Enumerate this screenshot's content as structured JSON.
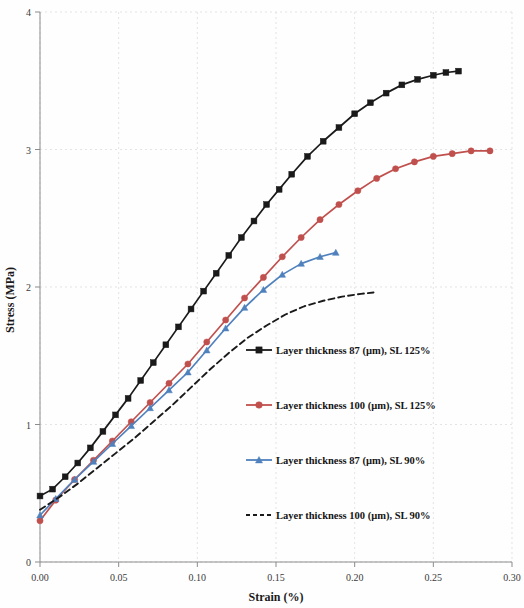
{
  "figure": {
    "background": "#fefefe",
    "plot_area": {
      "left": 40,
      "right": 512,
      "top": 12,
      "bottom": 562
    }
  },
  "chart_data": {
    "type": "line",
    "title": "",
    "xlabel": "Strain (%)",
    "ylabel": "Stress (MPa)",
    "xlim": [
      0.0,
      0.3
    ],
    "ylim": [
      0,
      4
    ],
    "xticks": [
      "0.00",
      "0.05",
      "0.10",
      "0.15",
      "0.20",
      "0.25",
      "0.30"
    ],
    "xtick_values": [
      0.0,
      0.05,
      0.1,
      0.15,
      0.2,
      0.25,
      0.3
    ],
    "yticks": [
      "0",
      "1",
      "2",
      "3",
      "4"
    ],
    "ytick_values": [
      0,
      1,
      2,
      3,
      4
    ],
    "grid": "y-dotted-light",
    "legend_position": "inside-right-lower",
    "series": [
      {
        "name": "Layer thickness 87 (µm), SL 125%",
        "color": "#1a1a1a",
        "marker": "square",
        "dash": "solid",
        "x": [
          0.0,
          0.008,
          0.016,
          0.024,
          0.032,
          0.04,
          0.048,
          0.056,
          0.064,
          0.072,
          0.08,
          0.088,
          0.096,
          0.104,
          0.112,
          0.12,
          0.128,
          0.136,
          0.144,
          0.152,
          0.16,
          0.17,
          0.18,
          0.19,
          0.2,
          0.21,
          0.22,
          0.23,
          0.24,
          0.25,
          0.258,
          0.266
        ],
        "y": [
          0.48,
          0.53,
          0.62,
          0.72,
          0.83,
          0.95,
          1.07,
          1.19,
          1.32,
          1.45,
          1.58,
          1.71,
          1.84,
          1.97,
          2.1,
          2.23,
          2.36,
          2.48,
          2.6,
          2.71,
          2.82,
          2.95,
          3.06,
          3.16,
          3.26,
          3.34,
          3.41,
          3.47,
          3.51,
          3.54,
          3.56,
          3.57
        ]
      },
      {
        "name": "Layer thickness 100 (µm), SL 125%",
        "color": "#C0504D",
        "marker": "circle",
        "dash": "solid",
        "x": [
          0.0,
          0.01,
          0.022,
          0.034,
          0.046,
          0.058,
          0.07,
          0.082,
          0.094,
          0.106,
          0.118,
          0.13,
          0.142,
          0.154,
          0.166,
          0.178,
          0.19,
          0.202,
          0.214,
          0.226,
          0.238,
          0.25,
          0.262,
          0.274,
          0.286
        ],
        "y": [
          0.3,
          0.45,
          0.6,
          0.74,
          0.88,
          1.02,
          1.16,
          1.3,
          1.44,
          1.6,
          1.76,
          1.92,
          2.07,
          2.22,
          2.36,
          2.49,
          2.6,
          2.7,
          2.79,
          2.86,
          2.91,
          2.95,
          2.97,
          2.99,
          2.99
        ]
      },
      {
        "name": "Layer thickness 87 (µm), SL 90%",
        "color": "#4F81BD",
        "marker": "triangle",
        "dash": "solid",
        "x": [
          0.0,
          0.01,
          0.022,
          0.034,
          0.046,
          0.058,
          0.07,
          0.082,
          0.094,
          0.106,
          0.118,
          0.13,
          0.142,
          0.154,
          0.166,
          0.178,
          0.188
        ],
        "y": [
          0.34,
          0.46,
          0.6,
          0.73,
          0.86,
          0.99,
          1.12,
          1.25,
          1.38,
          1.54,
          1.7,
          1.85,
          1.98,
          2.09,
          2.17,
          2.22,
          2.25
        ]
      },
      {
        "name": "Layer thickness 100 (µm), SL 90%",
        "color": "#1a1a1a",
        "marker": "none",
        "dash": "dashed",
        "x": [
          0.0,
          0.012,
          0.024,
          0.036,
          0.048,
          0.06,
          0.072,
          0.084,
          0.096,
          0.108,
          0.12,
          0.132,
          0.144,
          0.156,
          0.168,
          0.18,
          0.192,
          0.204,
          0.212
        ],
        "y": [
          0.38,
          0.47,
          0.57,
          0.68,
          0.79,
          0.9,
          1.02,
          1.14,
          1.27,
          1.4,
          1.52,
          1.63,
          1.72,
          1.8,
          1.86,
          1.9,
          1.93,
          1.95,
          1.96
        ]
      }
    ]
  },
  "legend": {
    "entries": [
      {
        "label": "Layer thickness 87 (µm), SL 125%",
        "color": "#1a1a1a",
        "marker": "square",
        "dash": "solid"
      },
      {
        "label": "Layer thickness 100 (µm), SL 125%",
        "color": "#C0504D",
        "marker": "circle",
        "dash": "solid"
      },
      {
        "label": "Layer thickness 87 (µm), SL 90%",
        "color": "#4F81BD",
        "marker": "triangle",
        "dash": "solid"
      },
      {
        "label": "Layer thickness 100 (µm), SL 90%",
        "color": "#1a1a1a",
        "marker": "none",
        "dash": "dashed"
      }
    ]
  }
}
